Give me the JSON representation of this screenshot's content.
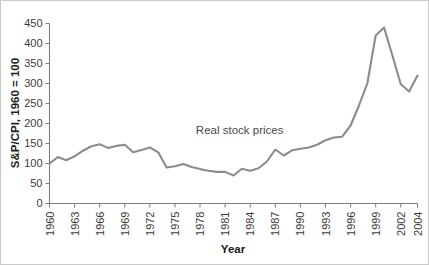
{
  "chart_data": {
    "type": "line",
    "title": "",
    "subtitle": "",
    "xlabel": "Year",
    "ylabel": "S&P/CPI, 1960 = 100",
    "xlim": [
      1960,
      2004
    ],
    "ylim": [
      0,
      450
    ],
    "grid": false,
    "legend_position": "none",
    "annotations": [
      {
        "text": "Real stock prices",
        "x": 1977.5,
        "y": 175
      }
    ],
    "xticks": [
      1960,
      1963,
      1966,
      1969,
      1972,
      1975,
      1978,
      1981,
      1984,
      1987,
      1990,
      1993,
      1996,
      1999,
      2002,
      2004
    ],
    "xtick_labels": [
      "1960",
      "1963",
      "1966",
      "1969",
      "1972",
      "1975",
      "1978",
      "1981",
      "1984",
      "1987",
      "1990",
      "1993",
      "1996",
      "1999",
      "2002",
      "2004"
    ],
    "yticks": [
      0,
      50,
      100,
      150,
      200,
      250,
      300,
      350,
      400,
      450
    ],
    "ytick_labels": [
      "0",
      "50",
      "100",
      "150",
      "200",
      "250",
      "300",
      "350",
      "400",
      "450"
    ],
    "series": [
      {
        "name": "Real stock prices",
        "color": "#8c8c8c",
        "x": [
          1960,
          1961,
          1962,
          1963,
          1964,
          1965,
          1966,
          1967,
          1968,
          1969,
          1970,
          1971,
          1972,
          1973,
          1974,
          1975,
          1976,
          1977,
          1978,
          1979,
          1980,
          1981,
          1982,
          1983,
          1984,
          1985,
          1986,
          1987,
          1988,
          1989,
          1990,
          1991,
          1992,
          1993,
          1994,
          1995,
          1996,
          1997,
          1998,
          1999,
          2000,
          2001,
          2002,
          2003,
          2004
        ],
        "values": [
          100,
          116,
          108,
          118,
          132,
          143,
          148,
          139,
          144,
          147,
          128,
          134,
          140,
          128,
          90,
          93,
          99,
          91,
          86,
          82,
          79,
          79,
          70,
          87,
          82,
          88,
          105,
          135,
          120,
          133,
          137,
          140,
          147,
          158,
          165,
          167,
          195,
          245,
          300,
          420,
          440,
          370,
          298,
          280,
          320
        ]
      }
    ]
  }
}
